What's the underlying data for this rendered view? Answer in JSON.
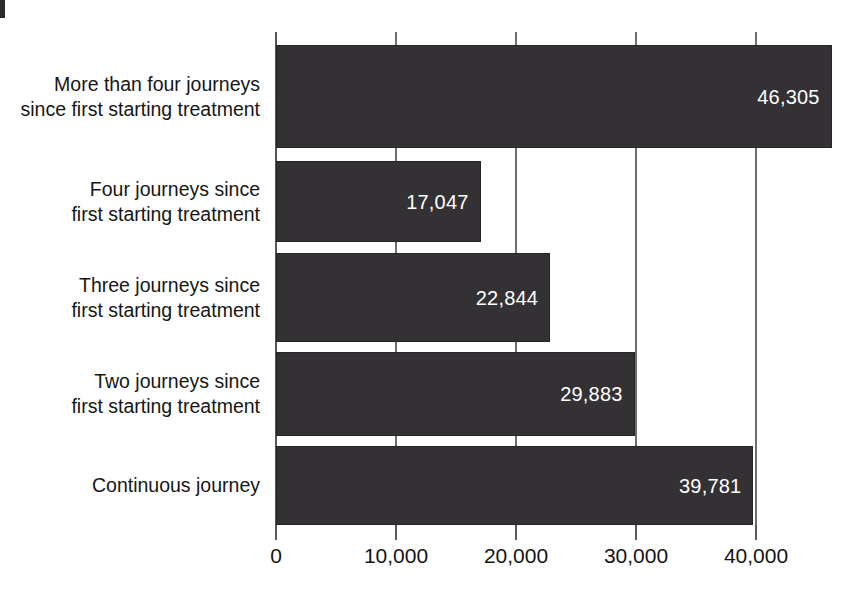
{
  "chart_data": {
    "type": "bar",
    "orientation": "horizontal",
    "title": "",
    "subtitle": "",
    "xlabel": "",
    "ylabel": "",
    "categories": [
      "More than four journeys since first starting treatment",
      "Four journeys since first starting treatment",
      "Three journeys since first starting treatment",
      "Two journeys since first starting treatment",
      "Continuous journey"
    ],
    "category_lines": [
      [
        "More than four journeys",
        "since first starting treatment"
      ],
      [
        "Four journeys since",
        "first starting treatment"
      ],
      [
        "Three journeys since",
        "first starting treatment"
      ],
      [
        "Two journeys since",
        "first starting treatment"
      ],
      [
        "Continuous journey"
      ]
    ],
    "values": [
      46305,
      17047,
      22844,
      29883,
      39781
    ],
    "value_labels": [
      "46,305",
      "17,047",
      "22,844",
      "29,883",
      "39,781"
    ],
    "xlim": [
      0,
      46305
    ],
    "xticks": [
      0,
      10000,
      20000,
      30000,
      40000
    ],
    "xtick_labels": [
      "0",
      "10,000",
      "20,000",
      "30,000",
      "40,000"
    ],
    "grid": true,
    "grid_axis": "x",
    "legend": false,
    "bar_color": "#333133",
    "value_label_color": "#ffffff",
    "axis_color": "#5a5a5a",
    "background_color": "#ffffff"
  },
  "bars": [
    {
      "label_line1": "More than four journeys",
      "label_line2": "since first starting treatment",
      "value": 46305,
      "value_label": "46,305"
    },
    {
      "label_line1": "Four journeys since",
      "label_line2": "first starting treatment",
      "value": 17047,
      "value_label": "17,047"
    },
    {
      "label_line1": "Three journeys since",
      "label_line2": "first starting treatment",
      "value": 22844,
      "value_label": "22,844"
    },
    {
      "label_line1": "Two journeys since",
      "label_line2": "first starting treatment",
      "value": 29883,
      "value_label": "29,883"
    },
    {
      "label_line1": "Continuous journey",
      "label_line2": "",
      "value": 39781,
      "value_label": "39,781"
    }
  ],
  "axis": {
    "ticks": [
      {
        "value": 0,
        "label": "0"
      },
      {
        "value": 10000,
        "label": "10,000"
      },
      {
        "value": 20000,
        "label": "20,000"
      },
      {
        "value": 30000,
        "label": "30,000"
      },
      {
        "value": 40000,
        "label": "40,000"
      }
    ]
  }
}
